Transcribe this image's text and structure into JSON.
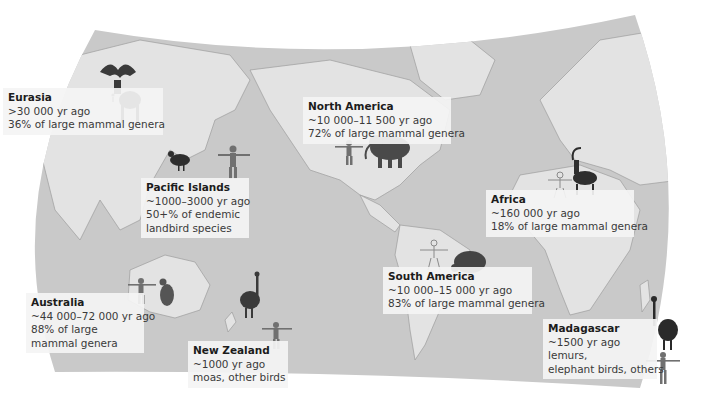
{
  "map": {
    "title": "Timing of human arrival and extinctions of megafauna by region",
    "colors": {
      "ocean": "#c6c6c6",
      "land": "#e4e4e4",
      "coast": "#9a9a9a",
      "label_bg": "#f4f4f4",
      "animal_dark": "#2e2e2e",
      "human": "#6e6e6e"
    },
    "regions": [
      {
        "id": "eurasia",
        "name": "Eurasia",
        "arrival": ">30 000 yr ago",
        "extinction": "36% of large mammal genera",
        "animal": "giant-deer-icon"
      },
      {
        "id": "north-america",
        "name": "North America",
        "arrival": "~10 000–11 500 yr ago",
        "extinction": "72% of large mammal genera",
        "animal": "mammoth-icon"
      },
      {
        "id": "pacific-islands",
        "name": "Pacific Islands",
        "arrival": "~1000–3000 yr ago",
        "extinction_lines": [
          "50+% of endemic",
          "landbird species"
        ],
        "animal": "flightless-bird-icon"
      },
      {
        "id": "africa",
        "name": "Africa",
        "arrival": "~160 000 yr ago",
        "extinction": "18% of large mammal genera",
        "animal": "antelope-icon"
      },
      {
        "id": "australia",
        "name": "Australia",
        "arrival": "~44 000–72 000 yr ago",
        "extinction_lines": [
          "88% of large",
          "mammal genera"
        ],
        "animal": "kangaroo-icon"
      },
      {
        "id": "south-america",
        "name": "South America",
        "arrival": "~10 000–15 000 yr ago",
        "extinction": "83% of large mammal genera",
        "animal": "glyptodont-icon"
      },
      {
        "id": "new-zealand",
        "name": "New Zealand",
        "arrival": "~1000 yr ago",
        "extinction": "moas, other birds",
        "animal": "moa-icon"
      },
      {
        "id": "madagascar",
        "name": "Madagascar",
        "arrival": "~1500 yr ago",
        "extinction_lines": [
          "lemurs,",
          "elephant birds, others"
        ],
        "animal": "elephant-bird-icon"
      }
    ]
  }
}
